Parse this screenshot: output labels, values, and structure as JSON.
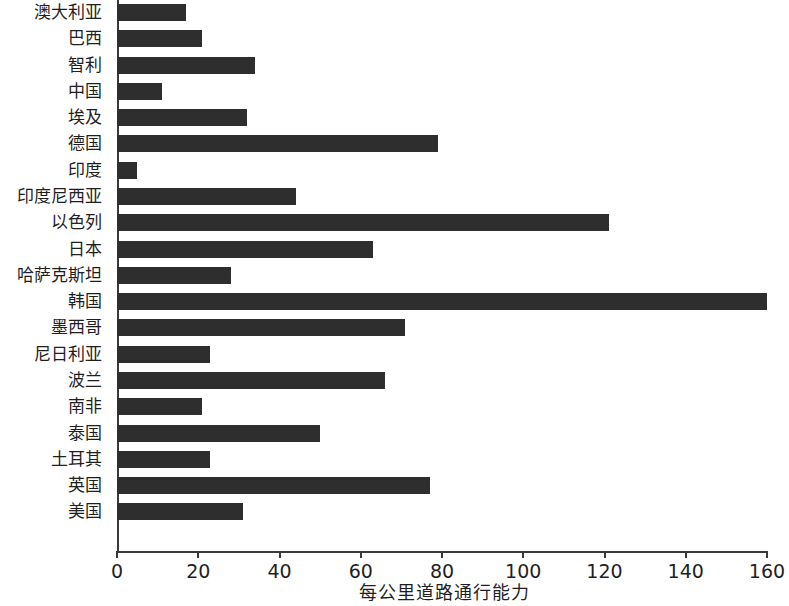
{
  "chart_data": {
    "type": "bar",
    "orientation": "horizontal",
    "title": "",
    "xlabel": "每公里道路通行能力",
    "ylabel": "",
    "xlim": [
      0,
      160
    ],
    "xticks": [
      0,
      20,
      40,
      60,
      80,
      100,
      120,
      140,
      160
    ],
    "xtick_labels": [
      "0",
      "20",
      "40",
      "60",
      "80",
      "100",
      "120",
      "140",
      "160"
    ],
    "grid": false,
    "legend": null,
    "bar_color": "#2e2e2e",
    "axis_color": "#3a3a3a",
    "categories": [
      "澳大利亚",
      "巴西",
      "智利",
      "中国",
      "埃及",
      "德国",
      "印度",
      "印度尼西亚",
      "以色列",
      "日本",
      "哈萨克斯坦",
      "韩国",
      "墨西哥",
      "尼日利亚",
      "波兰",
      "南非",
      "泰国",
      "土耳其",
      "英国",
      "美国"
    ],
    "values": [
      17,
      21,
      34,
      11,
      32,
      79,
      5,
      44,
      121,
      63,
      28,
      160,
      71,
      23,
      66,
      21,
      50,
      23,
      77,
      31
    ]
  }
}
